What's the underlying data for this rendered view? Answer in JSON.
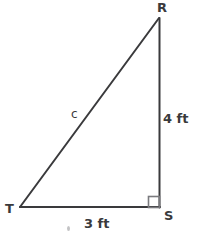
{
  "figure": {
    "type": "geometry-diagram",
    "shape": "right-triangle",
    "background_color": "#ffffff",
    "stroke_color": "#3a3a3c",
    "text_color": "#3a3a3c"
  },
  "vertices": {
    "apex": {
      "label": "R",
      "x": 159,
      "y": 18
    },
    "right_angle": {
      "label": "S",
      "x": 159,
      "y": 207
    },
    "left": {
      "label": "T",
      "x": 20,
      "y": 207
    }
  },
  "sides": {
    "vertical_leg": {
      "label": "4 ft",
      "value": 4,
      "unit": "ft",
      "from": "R",
      "to": "S"
    },
    "horizontal_leg": {
      "label": "3 ft",
      "value": 3,
      "unit": "ft",
      "from": "T",
      "to": "S"
    },
    "hypotenuse": {
      "label": "c",
      "from": "T",
      "to": "R"
    }
  },
  "markers": {
    "right_angle_square": {
      "at": "S",
      "size": 11
    }
  },
  "artifacts": {
    "speck": {
      "x": 67,
      "y": 226
    }
  }
}
